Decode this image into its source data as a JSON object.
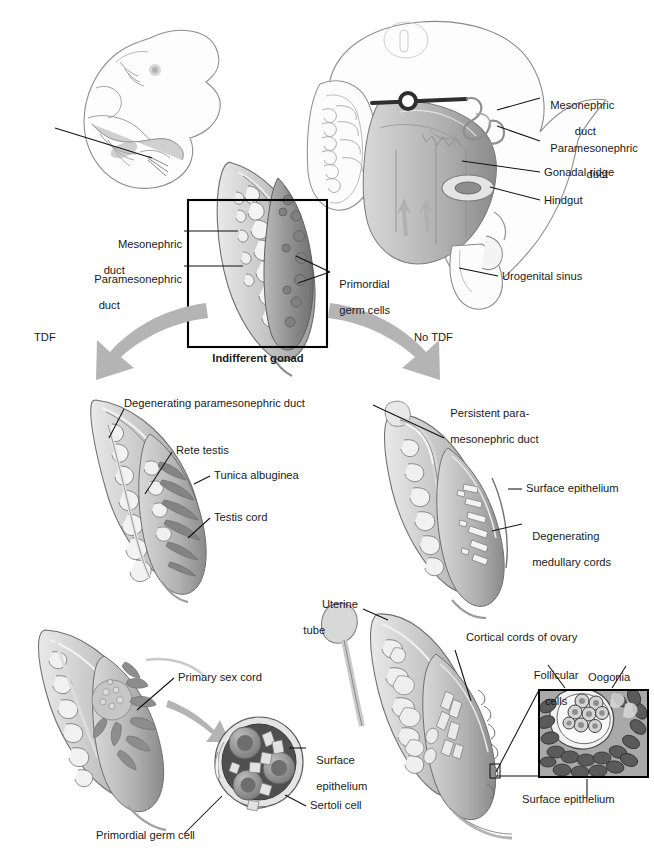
{
  "figure": {
    "background": "#ffffff",
    "ink_color": "#1a1a1a",
    "arrow_color": "#b4b4b4"
  },
  "top_left_panel": {
    "name": "embryo-overview",
    "description": "Lateral view of whole embryo with pointer line to gonadal region"
  },
  "top_right_panel": {
    "name": "posterior-abdominal-wall",
    "labels": [
      {
        "id": "mesonephric-duct",
        "text": "Mesonephric\nduct",
        "line1": "Mesonephric",
        "line2": "duct"
      },
      {
        "id": "paramesonephric-duct",
        "text": "Paramesonephric\nduct",
        "line1": "Paramesonephric",
        "line2": "duct"
      },
      {
        "id": "gonadal-ridge",
        "text": "Gonadal ridge"
      },
      {
        "id": "hindgut",
        "text": "Hindgut"
      },
      {
        "id": "urogenital-sinus",
        "text": "Urogenital sinus"
      }
    ]
  },
  "indifferent_gonad_panel": {
    "name": "indifferent-gonad",
    "caption": "Indifferent gonad",
    "labels": [
      {
        "id": "mesonephric-duct",
        "line1": "Mesonephric",
        "line2": "duct"
      },
      {
        "id": "paramesonephric-duct",
        "line1": "Paramesonephric",
        "line2": "duct"
      },
      {
        "id": "primordial-germ-cells",
        "line1": "Primordial",
        "line2": "germ cells"
      }
    ]
  },
  "pathways": {
    "male_branch_label": "TDF",
    "female_branch_label": "No TDF"
  },
  "testis_panel_upper": {
    "name": "developing-testis",
    "labels": [
      {
        "id": "degenerating-paramesonephric-duct",
        "text": "Degenerating paramesonephric duct"
      },
      {
        "id": "rete-testis",
        "text": "Rete testis"
      },
      {
        "id": "tunica-albuginea",
        "text": "Tunica albuginea"
      },
      {
        "id": "testis-cord",
        "text": "Testis cord"
      }
    ]
  },
  "ovary_panel_upper": {
    "name": "developing-ovary-early",
    "labels": [
      {
        "id": "persistent-paramesonephric-duct",
        "line1": "Persistent para-",
        "line2": "mesonephric duct"
      },
      {
        "id": "surface-epithelium",
        "text": "Surface epithelium"
      },
      {
        "id": "degenerating-medullary-cords",
        "line1": "Degenerating",
        "line2": "medullary cords"
      }
    ]
  },
  "testis_panel_lower": {
    "name": "testis-with-seminiferous-inset",
    "labels": [
      {
        "id": "primary-sex-cord",
        "text": "Primary sex cord"
      },
      {
        "id": "surface-epithelium",
        "line1": "Surface",
        "line2": "epithelium"
      },
      {
        "id": "sertoli-cell",
        "text": "Sertoli cell"
      },
      {
        "id": "primordial-germ-cell",
        "text": "Primordial germ cell"
      }
    ]
  },
  "ovary_panel_lower": {
    "name": "ovary-with-cortical-cord-inset",
    "labels": [
      {
        "id": "uterine-tube",
        "line1": "Uterine",
        "line2": "tube"
      },
      {
        "id": "cortical-cords-of-ovary",
        "text": "Cortical cords of ovary"
      },
      {
        "id": "follicular-cells",
        "line1": "Follicular",
        "line2": "cells"
      },
      {
        "id": "oogonia",
        "text": "Oogonia"
      },
      {
        "id": "surface-epithelium",
        "text": "Surface epithelium"
      }
    ]
  }
}
